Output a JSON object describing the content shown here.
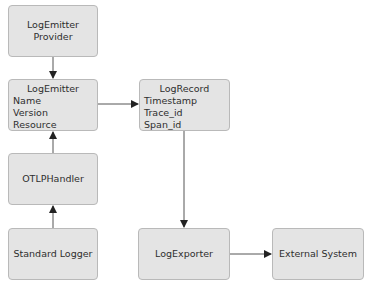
{
  "diagram": {
    "nodes": {
      "provider": {
        "lines": [
          "LogEmitter",
          "Provider"
        ]
      },
      "emitter": {
        "title": "LogEmitter",
        "fields": [
          "Name",
          "Version",
          "Resource"
        ]
      },
      "record": {
        "title": "LogRecord",
        "fields": [
          "Timestamp",
          "Trace_id",
          "Span_id"
        ]
      },
      "handler": {
        "label": "OTLPHandler"
      },
      "logger": {
        "label": "Standard Logger"
      },
      "exporter": {
        "label": "LogExporter"
      },
      "external": {
        "label": "External System"
      }
    },
    "edges": [
      {
        "from": "LogEmitter Provider",
        "to": "LogEmitter"
      },
      {
        "from": "LogEmitter",
        "to": "LogRecord"
      },
      {
        "from": "OTLPHandler",
        "to": "LogEmitter"
      },
      {
        "from": "Standard Logger",
        "to": "OTLPHandler"
      },
      {
        "from": "LogRecord",
        "to": "LogExporter"
      },
      {
        "from": "LogExporter",
        "to": "External System"
      }
    ],
    "colors": {
      "node_fill": "#e4e4e4",
      "node_border": "#b9b9b9",
      "edge": "#444444",
      "text": "#2e2e2e"
    }
  }
}
